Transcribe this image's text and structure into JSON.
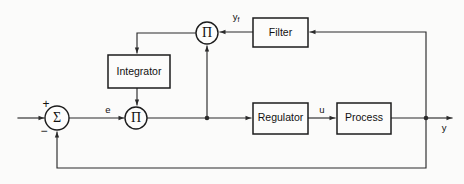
{
  "diagram": {
    "type": "control-system-block-diagram",
    "background_color": "#fbfbfa",
    "line_color": "#2b2b2b",
    "blocks": [
      {
        "id": "integrator",
        "label": "Integrator",
        "shape": "rectangle",
        "x": 108,
        "y": 55,
        "w": 62,
        "h": 33
      },
      {
        "id": "filter",
        "label": "Filter",
        "shape": "rectangle",
        "x": 253,
        "y": 18,
        "w": 55,
        "h": 29
      },
      {
        "id": "regulator",
        "label": "Regulator",
        "shape": "rectangle",
        "x": 253,
        "y": 103,
        "w": 55,
        "h": 31
      },
      {
        "id": "process",
        "label": "Process",
        "shape": "rectangle",
        "x": 337,
        "y": 103,
        "w": 54,
        "h": 31
      }
    ],
    "operators": [
      {
        "id": "sum-junction",
        "symbol": "Σ",
        "name": "summing-junction",
        "cx": 57,
        "cy": 118,
        "r": 12
      },
      {
        "id": "product-lower",
        "symbol": "Π",
        "name": "multiplier-lower",
        "cx": 136,
        "cy": 118,
        "r": 11
      },
      {
        "id": "product-upper",
        "symbol": "Π",
        "name": "multiplier-upper",
        "cx": 207,
        "cy": 33,
        "r": 11
      }
    ],
    "signs": [
      {
        "id": "plus",
        "char": "+",
        "x": 46,
        "y": 105
      },
      {
        "id": "minus",
        "char": "−",
        "x": 44,
        "y": 132
      }
    ],
    "signals": [
      {
        "id": "error",
        "label": "e",
        "sub": "",
        "x": 108,
        "y": 110
      },
      {
        "id": "control",
        "label": "u",
        "sub": "",
        "x": 322,
        "y": 110
      },
      {
        "id": "filtered-output",
        "label": "y",
        "sub": "f",
        "x": 236,
        "y": 17
      },
      {
        "id": "output",
        "label": "y",
        "sub": "",
        "x": 444,
        "y": 128
      }
    ]
  }
}
